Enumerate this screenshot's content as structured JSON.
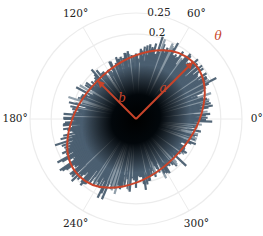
{
  "chart_data": {
    "type": "polar-bar",
    "title": "",
    "center_px": [
      136,
      119
    ],
    "px_per_unit": 424,
    "rlim": [
      0,
      0.25
    ],
    "radial_ticks": [
      {
        "value": 0.2,
        "label": "0.2"
      },
      {
        "value": 0.25,
        "label": "0.25"
      }
    ],
    "angular_ticks": [
      {
        "deg": 0,
        "label": "0°"
      },
      {
        "deg": 60,
        "label": "60°"
      },
      {
        "deg": 120,
        "label": "120°"
      },
      {
        "deg": 180,
        "label": "180°"
      },
      {
        "deg": 240,
        "label": "240°"
      },
      {
        "deg": 300,
        "label": "300°"
      }
    ],
    "grid": true,
    "bars": {
      "count": 360,
      "color_outer": "#4a5e70",
      "color_inner": "#000000",
      "noise_amplitude": 0.03,
      "description": "Noisy radial histogram following the fitted ellipse"
    },
    "ellipse_fit": {
      "a": 0.19,
      "b": 0.128,
      "theta_deg": 45,
      "color": "#c8442a",
      "labels": {
        "a": "a",
        "b": "b",
        "theta": "θ"
      }
    }
  }
}
